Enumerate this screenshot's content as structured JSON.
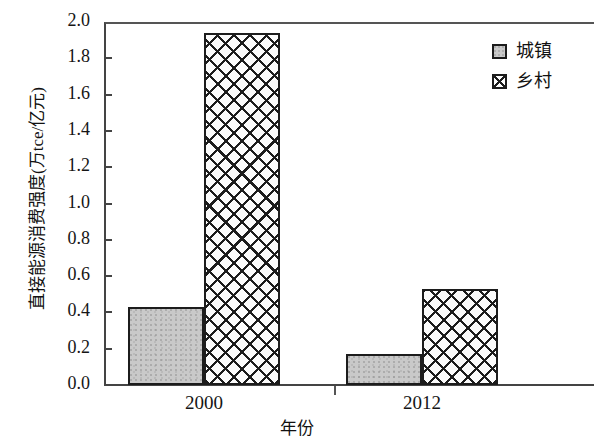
{
  "chart_data": {
    "type": "bar",
    "title": "",
    "xlabel": "年份",
    "ylabel": "直接能源消费强度(万tce/亿元)",
    "categories": [
      "2000",
      "2012"
    ],
    "series": [
      {
        "name": "城镇",
        "values": [
          0.43,
          0.17
        ],
        "fill": "solid-gray",
        "color": "#c9c9c9"
      },
      {
        "name": "乡村",
        "values": [
          1.94,
          0.53
        ],
        "fill": "cross-hatch",
        "color": "#ffffff"
      }
    ],
    "ylim": [
      0.0,
      2.0
    ],
    "ytick_step": 0.2,
    "ytick_labels": [
      "0.0",
      "0.2",
      "0.4",
      "0.6",
      "0.8",
      "1.0",
      "1.2",
      "1.4",
      "1.6",
      "1.8",
      "2.0"
    ],
    "grid": false,
    "legend_position": "top-right",
    "axis_color": "#444444",
    "bar_edge_color": "#1c1c1c"
  },
  "axis": {
    "y_title": "直接能源消费强度(万tce/亿元)",
    "x_title": "年份"
  },
  "legend": {
    "items": [
      {
        "label": "城镇"
      },
      {
        "label": "乡村"
      }
    ]
  }
}
